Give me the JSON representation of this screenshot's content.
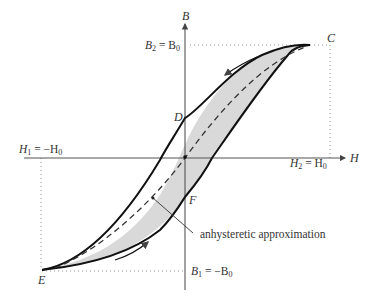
{
  "diagram": {
    "axes": {
      "x_label": "H",
      "y_label": "B"
    },
    "labels": {
      "B2": "B",
      "B2_sub": "2",
      "B2_eq": " = B",
      "B2_sub0": "0",
      "B1": "B",
      "B1_sub": "1",
      "B1_eq": " = −B",
      "B1_sub0": "0",
      "H1": "H",
      "H1_sub": "1",
      "H1_eq": " = −H",
      "H1_sub0": "0",
      "H2": "H",
      "H2_sub": "2",
      "H2_eq": " = H",
      "H2_sub0": "0",
      "C": "C",
      "D": "D",
      "E": "E",
      "F": "F",
      "annotation": "anhysteretic approximation"
    },
    "points": {
      "C": {
        "description": "positive saturation (H0, B0)"
      },
      "D": {
        "description": "remanence on descending branch (H=0, B>0)"
      },
      "E": {
        "description": "negative saturation (-H0, -B0)"
      },
      "F": {
        "description": "remanence on ascending branch (H=0, B<0)"
      }
    },
    "colors": {
      "loop_fill": "#d9d9d9",
      "curve": "#111111",
      "axis": "#555555",
      "dotted": "#888888",
      "text": "#333333"
    }
  }
}
